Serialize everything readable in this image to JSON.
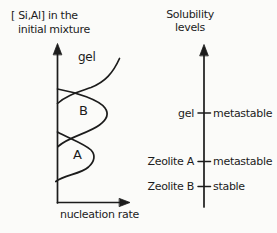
{
  "colors": {
    "ink": "#1c1c1c",
    "paper": "#fbfbf9"
  },
  "left_plot": {
    "y_axis_label_line1": "[ Si,Al] in the",
    "y_axis_label_line2": "initial mixture",
    "x_axis_label": "nucleation rate",
    "region_gel_label": "gel",
    "curve_b_label": "B",
    "curve_a_label": "A"
  },
  "right_scale": {
    "title_line1": "Solubility",
    "title_line2": "levels",
    "levels": [
      {
        "phase": "gel",
        "stability": "metastable"
      },
      {
        "phase": "Zeolite A",
        "stability": "metastable"
      },
      {
        "phase": "Zeolite B",
        "stability": "stable"
      }
    ]
  }
}
